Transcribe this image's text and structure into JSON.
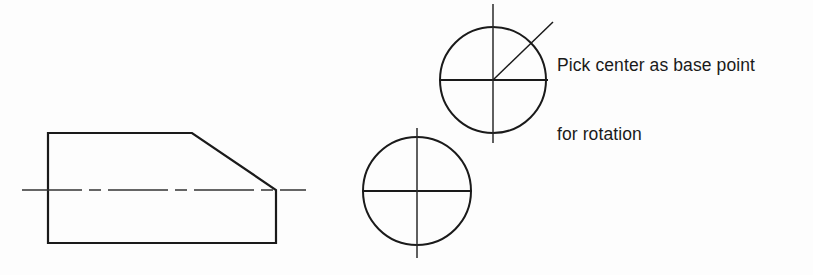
{
  "canvas": {
    "width": 813,
    "height": 275,
    "background_color": "#fdfdfd",
    "ink_color": "#1a1a1a"
  },
  "annotation": {
    "line1": "Pick center as base point",
    "line2": "for rotation",
    "x": 557,
    "y": 8,
    "font_size": 17.5
  },
  "chart_data": {
    "type": "diagram",
    "subtype": "cad-technical-drawing",
    "units": "pixels",
    "background": "#fdfdfd",
    "stroke_color": "#1a1a1a",
    "shapes": [
      {
        "name": "chamfered-block-outline",
        "type": "polygon",
        "closed": true,
        "stroke_width": 2.2,
        "points": [
          [
            48,
            133
          ],
          [
            192,
            133
          ],
          [
            276,
            190
          ],
          [
            276,
            243
          ],
          [
            48,
            243
          ]
        ]
      },
      {
        "name": "block-horizontal-centerline",
        "type": "centerline",
        "orientation": "horizontal",
        "stroke_width": 1.4,
        "dash_pattern": "60 7 12 7",
        "x1": 22,
        "y1": 190,
        "x2": 306,
        "y2": 190
      },
      {
        "name": "upper-circle",
        "type": "circle",
        "cx": 493,
        "cy": 80,
        "r": 53,
        "stroke_width": 2.0
      },
      {
        "name": "upper-circle-horizontal-centerline",
        "type": "line",
        "stroke_width": 1.8,
        "x1": 439,
        "y1": 80,
        "x2": 548,
        "y2": 80
      },
      {
        "name": "upper-circle-vertical-centerline",
        "type": "line",
        "stroke_width": 1.5,
        "x1": 493,
        "y1": 4,
        "x2": 493,
        "y2": 143
      },
      {
        "name": "lower-circle",
        "type": "circle",
        "cx": 417,
        "cy": 191,
        "r": 54,
        "stroke_width": 2.0
      },
      {
        "name": "lower-circle-horizontal-centerline",
        "type": "line",
        "stroke_width": 1.8,
        "x1": 362,
        "y1": 191,
        "x2": 472,
        "y2": 191
      },
      {
        "name": "lower-circle-vertical-centerline",
        "type": "line",
        "stroke_width": 1.5,
        "x1": 417,
        "y1": 128,
        "x2": 417,
        "y2": 258
      },
      {
        "name": "annotation-leader-line",
        "type": "line",
        "stroke_width": 1.5,
        "x1": 493,
        "y1": 80,
        "x2": 553,
        "y2": 22
      }
    ]
  }
}
